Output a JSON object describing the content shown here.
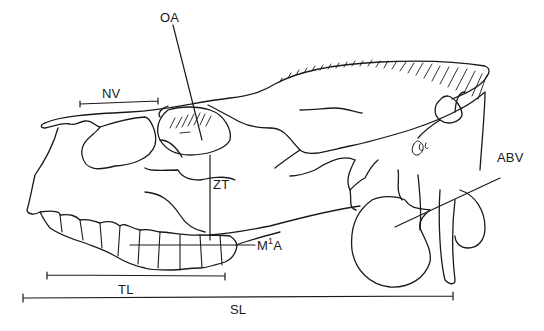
{
  "figure": {
    "stroke_color": "#1a1a1a",
    "background": "#ffffff"
  },
  "labels": {
    "oa": "OA",
    "nv": "NV",
    "zt": "ZT",
    "m1a_main": "M",
    "m1a_sup": "1",
    "m1a_tail": "A",
    "abv": "ABV",
    "tl": "TL",
    "sl": "SL"
  },
  "measurements": [
    {
      "id": "NV",
      "type": "horizontal-bar"
    },
    {
      "id": "OA",
      "type": "pointer-line"
    },
    {
      "id": "ZT",
      "type": "vertical-line"
    },
    {
      "id": "M1A",
      "type": "pointer-line"
    },
    {
      "id": "ABV",
      "type": "pointer-line"
    },
    {
      "id": "TL",
      "type": "horizontal-bar"
    },
    {
      "id": "SL",
      "type": "horizontal-bar"
    }
  ]
}
